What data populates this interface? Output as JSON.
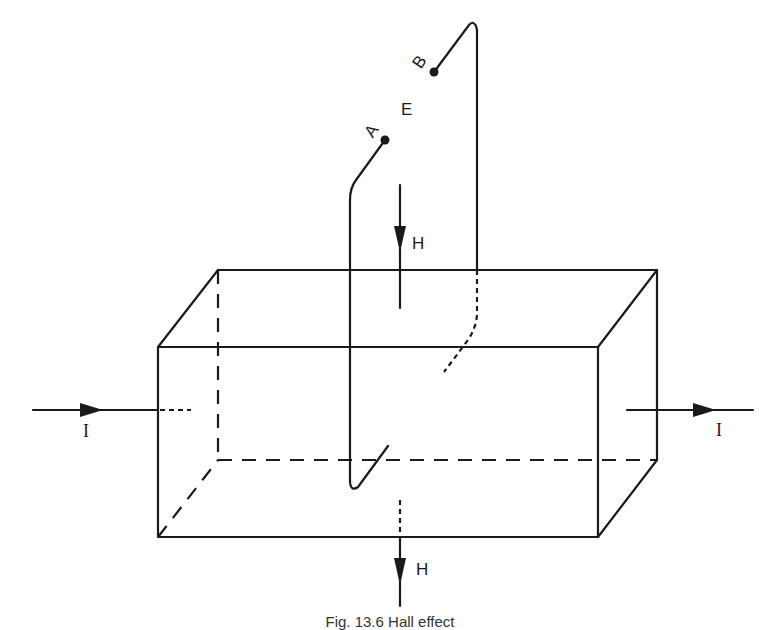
{
  "figure": {
    "caption": "Fig. 13.6 Hall effect",
    "labels": {
      "probe_a": "A",
      "probe_b": "B",
      "field_e": "E",
      "field_h_top": "H",
      "field_h_bottom": "H",
      "current_in": "I",
      "current_out": "I"
    },
    "colors": {
      "line": "#1a1a1a",
      "background": "#ffffff"
    }
  }
}
